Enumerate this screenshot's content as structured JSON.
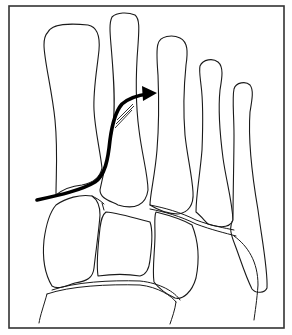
{
  "figure": {
    "frame_color": "#333333",
    "line_color": "#1a1a1a",
    "arrow_color": "#000000",
    "background": "#ffffff"
  },
  "elements": {
    "bones": [
      {
        "name": "first-metatarsal"
      },
      {
        "name": "second-metatarsal"
      },
      {
        "name": "third-metatarsal"
      },
      {
        "name": "fourth-metatarsal"
      },
      {
        "name": "fifth-metatarsal"
      },
      {
        "name": "medial-cuneiform"
      },
      {
        "name": "intermediate-cuneiform"
      },
      {
        "name": "lateral-cuneiform"
      },
      {
        "name": "cuboid"
      },
      {
        "name": "navicular"
      }
    ],
    "arrow": {
      "direction": "from lower-left curving up to the right",
      "label": ""
    }
  }
}
